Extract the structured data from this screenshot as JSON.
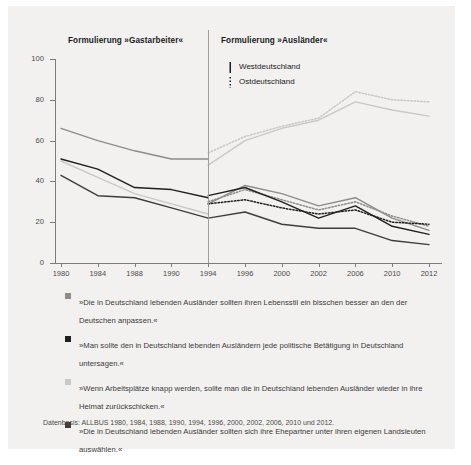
{
  "panels": {
    "left_title": "Formulierung »Gastarbeiter«",
    "right_title": "Formulierung »Ausländer«"
  },
  "key": {
    "west_label": "Westdeutschland",
    "east_label": "Ostdeutschland",
    "west_style": "solid",
    "east_style": "dotted"
  },
  "legend": [
    {
      "bullet_color": "#8c8c8c",
      "text": "»Die in Deutschland lebenden Ausländer sollten ihren Lebensstil ein bisschen besser an den der Deutschen anpassen.«"
    },
    {
      "bullet_color": "#1f1f1f",
      "text": "»Man sollte den in Deutschland lebenden Ausländern jede politische Betätigung in Deutschland untersagen.«"
    },
    {
      "bullet_color": "#c8c8c8",
      "text": "»Wenn Arbeitsplätze knapp werden, sollte man die in Deutschland lebenden Ausländer wieder in ihre Heimat zurückschicken.«"
    },
    {
      "bullet_color": "#3d3d3d",
      "text": "»Die in Deutschland lebenden Ausländer sollten sich ihre Ehepartner unter ihren eigenen Landsleuten auswählen.«"
    }
  ],
  "source": "Datenbasis: ALLBUS 1980, 1984, 1988, 1990, 1994, 1996, 2000, 2002, 2006, 2010 und 2012.",
  "colors": {
    "card_bg": "#f2f1ef",
    "axis": "#7d7d7d",
    "divider": "#9e9e9e",
    "lebensstil": "#8c8c8c",
    "politik": "#1f1f1f",
    "arbeitsplaetze": "#c8c8c8",
    "ehepartner": "#3d3d3d"
  },
  "chart_data": {
    "type": "line",
    "xlabel": "",
    "ylabel": "",
    "ylim": [
      0,
      100
    ],
    "yticks": [
      0,
      20,
      40,
      60,
      80,
      100
    ],
    "grid": false,
    "legend_position": "top-right inside plot",
    "categories": [
      "1980",
      "1984",
      "1988",
      "1990",
      "1994",
      "1996",
      "2000",
      "2002",
      "2006",
      "2010",
      "2012"
    ],
    "panel_split_at": "1994",
    "panels": [
      {
        "name": "Formulierung »Gastarbeiter«",
        "years": [
          "1980",
          "1984",
          "1988",
          "1990",
          "1994"
        ]
      },
      {
        "name": "Formulierung »Ausländer«",
        "years": [
          "1994",
          "1996",
          "2000",
          "2002",
          "2006",
          "2010",
          "2012"
        ]
      }
    ],
    "series": [
      {
        "name": "Lebensstil anpassen — Gastarbeiter (West)",
        "item": "lebensstil",
        "wording": "Gastarbeiter",
        "region": "Westdeutschland",
        "style": "solid",
        "color": "#8c8c8c",
        "x": [
          "1980",
          "1984",
          "1988",
          "1990",
          "1994"
        ],
        "values": [
          66,
          60,
          55,
          51,
          51
        ]
      },
      {
        "name": "Politische Betätigung untersagen — Gastarbeiter (West)",
        "item": "politik",
        "wording": "Gastarbeiter",
        "region": "Westdeutschland",
        "style": "solid",
        "color": "#1f1f1f",
        "x": [
          "1980",
          "1984",
          "1988",
          "1990",
          "1994"
        ],
        "values": [
          51,
          46,
          37,
          36,
          32
        ]
      },
      {
        "name": "Arbeitsplätze knapp — zurückschicken — Gastarbeiter (West)",
        "item": "arbeitsplaetze",
        "wording": "Gastarbeiter",
        "region": "Westdeutschland",
        "style": "solid",
        "color": "#c8c8c8",
        "x": [
          "1980",
          "1984",
          "1988",
          "1990",
          "1994"
        ],
        "values": [
          50,
          42,
          34,
          29,
          24
        ]
      },
      {
        "name": "Ehepartner aus eigenen Landsleuten — Gastarbeiter (West)",
        "item": "ehepartner",
        "wording": "Gastarbeiter",
        "region": "Westdeutschland",
        "style": "solid",
        "color": "#3d3d3d",
        "x": [
          "1980",
          "1984",
          "1988",
          "1990",
          "1994"
        ],
        "values": [
          43,
          33,
          32,
          27,
          22
        ]
      },
      {
        "name": "Arbeitsplätze knapp — zurückschicken (West)",
        "item": "arbeitsplaetze",
        "wording": "Ausländer",
        "region": "Westdeutschland",
        "style": "solid",
        "color": "#c8c8c8",
        "x": [
          "1994",
          "1996",
          "2000",
          "2002",
          "2006",
          "2010",
          "2012"
        ],
        "values": [
          48,
          60,
          66,
          70,
          79,
          75,
          72
        ]
      },
      {
        "name": "Arbeitsplätze knapp — zurückschicken (Ost)",
        "item": "arbeitsplaetze",
        "wording": "Ausländer",
        "region": "Ostdeutschland",
        "style": "dotted",
        "color": "#c8c8c8",
        "x": [
          "1994",
          "1996",
          "2000",
          "2002",
          "2006",
          "2010",
          "2012"
        ],
        "values": [
          54,
          62,
          67,
          71,
          84,
          80,
          79
        ]
      },
      {
        "name": "Lebensstil anpassen (West)",
        "item": "lebensstil",
        "wording": "Ausländer",
        "region": "Westdeutschland",
        "style": "solid",
        "color": "#8c8c8c",
        "x": [
          "1994",
          "1996",
          "2000",
          "2002",
          "2006",
          "2010",
          "2012"
        ],
        "values": [
          29,
          38,
          34,
          28,
          32,
          22,
          16
        ]
      },
      {
        "name": "Lebensstil anpassen (Ost)",
        "item": "lebensstil",
        "wording": "Ausländer",
        "region": "Ostdeutschland",
        "style": "dotted",
        "color": "#8c8c8c",
        "x": [
          "1994",
          "1996",
          "2000",
          "2002",
          "2006",
          "2010",
          "2012"
        ],
        "values": [
          30,
          36,
          31,
          26,
          30,
          23,
          18
        ]
      },
      {
        "name": "Politische Betätigung untersagen (West)",
        "item": "politik",
        "wording": "Ausländer",
        "region": "Westdeutschland",
        "style": "solid",
        "color": "#1f1f1f",
        "x": [
          "1994",
          "1996",
          "2000",
          "2002",
          "2006",
          "2010",
          "2012"
        ],
        "values": [
          33,
          37,
          30,
          22,
          28,
          18,
          14
        ]
      },
      {
        "name": "Politische Betätigung untersagen (Ost)",
        "item": "politik",
        "wording": "Ausländer",
        "region": "Ostdeutschland",
        "style": "dotted",
        "color": "#1f1f1f",
        "x": [
          "1994",
          "1996",
          "2000",
          "2002",
          "2006",
          "2010",
          "2012"
        ],
        "values": [
          29,
          31,
          27,
          24,
          26,
          20,
          19
        ]
      },
      {
        "name": "Ehepartner aus eigenen Landsleuten (West)",
        "item": "ehepartner",
        "wording": "Ausländer",
        "region": "Westdeutschland",
        "style": "solid",
        "color": "#3d3d3d",
        "x": [
          "1994",
          "1996",
          "2000",
          "2002",
          "2006",
          "2010",
          "2012"
        ],
        "values": [
          22,
          25,
          19,
          17,
          17,
          11,
          9
        ]
      }
    ]
  }
}
